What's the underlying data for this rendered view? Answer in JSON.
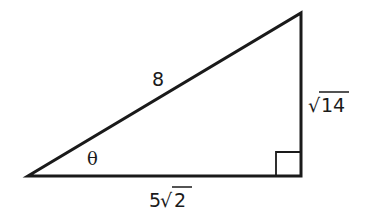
{
  "diagram": {
    "type": "right-triangle",
    "stroke_color": "#1a1a1a",
    "background": "#ffffff",
    "vertices": {
      "left": {
        "x": 28,
        "y": 176
      },
      "right_angle": {
        "x": 301,
        "y": 176
      },
      "top": {
        "x": 301,
        "y": 13
      }
    },
    "labels": {
      "hypotenuse": "8",
      "vertical_leg_radical": "√",
      "vertical_leg_radicand": "14",
      "horizontal_leg_coefficient": "5",
      "horizontal_leg_radical": "√",
      "horizontal_leg_radicand": "2",
      "angle": "θ"
    },
    "right_angle_marker": {
      "size": 25
    }
  }
}
